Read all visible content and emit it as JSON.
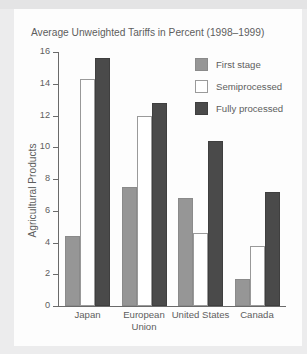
{
  "scan": {
    "top_strip_ghost_text": ""
  },
  "chart_data": {
    "type": "bar",
    "title": "Average Unweighted Tariffs in Percent (1998–1999)",
    "xlabel": "",
    "ylabel": "Agricultural Products",
    "ylim": [
      0,
      16
    ],
    "ytick_labels": [
      "16",
      "14",
      "12",
      "10",
      "8",
      "6",
      "4",
      "2",
      "0"
    ],
    "ytick_values": [
      16,
      14,
      12,
      10,
      8,
      6,
      4,
      2,
      0
    ],
    "grid": false,
    "legend_position": "top-right",
    "categories": [
      "Japan",
      "European Union",
      "United States",
      "Canada"
    ],
    "category_label_lines": [
      [
        "Japan"
      ],
      [
        "European",
        "Union"
      ],
      [
        "United States"
      ],
      [
        "Canada"
      ]
    ],
    "series": [
      {
        "name": "First stage",
        "color": "#969696",
        "values": [
          4.4,
          7.5,
          6.8,
          1.7
        ]
      },
      {
        "name": "Semiprocessed",
        "color": "#ffffff",
        "values": [
          14.3,
          12.0,
          4.6,
          3.8
        ]
      },
      {
        "name": "Fully processed",
        "color": "#4a4a4a",
        "values": [
          15.6,
          12.8,
          10.4,
          7.2
        ]
      }
    ]
  }
}
